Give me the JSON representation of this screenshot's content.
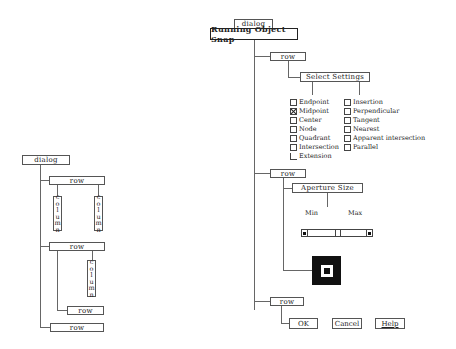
{
  "left_diagram": {
    "root": "dialog",
    "row1": "row",
    "row1_columns": [
      "column",
      "column"
    ],
    "row2": "row",
    "row2_column": "column",
    "row2_subrow": "row",
    "row3": "row"
  },
  "right_diagram": {
    "dialog_tab": "dialog",
    "title": "Running Object Snap",
    "row1": {
      "label": "row",
      "group_title": "Select Settings",
      "left_options": [
        {
          "label": "Endpoint",
          "checked": false
        },
        {
          "label": "Midpoint",
          "checked": true
        },
        {
          "label": "Center",
          "checked": false
        },
        {
          "label": "Node",
          "checked": false
        },
        {
          "label": "Quadrant",
          "checked": false
        },
        {
          "label": "Intersection",
          "checked": false
        },
        {
          "label": "Extension",
          "checked": false
        }
      ],
      "right_options": [
        {
          "label": "Insertion",
          "checked": false
        },
        {
          "label": "Perpendicular",
          "checked": false
        },
        {
          "label": "Tangent",
          "checked": false
        },
        {
          "label": "Nearest",
          "checked": false
        },
        {
          "label": "Apparent intersection",
          "checked": false
        },
        {
          "label": "Parallel",
          "checked": false
        }
      ]
    },
    "row2": {
      "label": "row",
      "group_title": "Aperture Size",
      "min_label": "Min",
      "max_label": "Max"
    },
    "row3": {
      "label": "row",
      "buttons": [
        "OK",
        "Cancel",
        "Help"
      ]
    }
  }
}
